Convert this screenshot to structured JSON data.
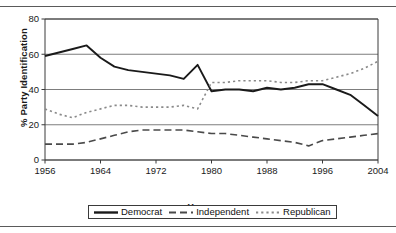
{
  "chart_data": {
    "type": "line",
    "title": "",
    "xlabel": "Year",
    "ylabel": "% Party Identification",
    "xlim": [
      1956,
      2004
    ],
    "ylim": [
      0,
      80
    ],
    "xticks": [
      1956,
      1964,
      1972,
      1980,
      1988,
      1996,
      2004
    ],
    "yticks": [
      0,
      20,
      40,
      60,
      80
    ],
    "grid": "horizontal",
    "legend_position": "bottom",
    "x": [
      1956,
      1958,
      1960,
      1962,
      1964,
      1966,
      1968,
      1970,
      1972,
      1974,
      1976,
      1978,
      1980,
      1982,
      1984,
      1986,
      1988,
      1990,
      1992,
      1994,
      1996,
      1998,
      2000,
      2002,
      2004
    ],
    "series": [
      {
        "name": "Democrat",
        "style": "solid",
        "color": "#1a1a1a",
        "values": [
          59,
          61,
          63,
          65,
          58,
          53,
          51,
          50,
          49,
          48,
          46,
          54,
          39,
          40,
          40,
          39,
          41,
          40,
          41,
          43,
          43,
          40,
          37,
          31,
          25
        ]
      },
      {
        "name": "Independent",
        "style": "dashed",
        "color": "#4a4a4a",
        "values": [
          9,
          9,
          9,
          10,
          12,
          14,
          16,
          17,
          17,
          17,
          17,
          16,
          15,
          15,
          14,
          13,
          12,
          11,
          10,
          8,
          11,
          12,
          13,
          14,
          15
        ]
      },
      {
        "name": "Republican",
        "style": "dotted",
        "color": "#8a8a8a",
        "values": [
          29,
          26,
          24,
          27,
          29,
          31,
          31,
          30,
          30,
          30,
          31,
          29,
          44,
          44,
          45,
          45,
          45,
          44,
          44,
          45,
          45,
          47,
          49,
          52,
          56
        ]
      }
    ]
  },
  "legend": {
    "items": [
      {
        "label": "Democrat",
        "style": "solid"
      },
      {
        "label": "Independent",
        "style": "dashed"
      },
      {
        "label": "Republican",
        "style": "dotted"
      }
    ]
  },
  "axes": {
    "y_label": "% Party Identification",
    "x_label": "Year",
    "y_ticks": [
      "80",
      "60",
      "40",
      "20",
      "0"
    ],
    "x_ticks": [
      "1956",
      "1964",
      "1972",
      "1980",
      "1988",
      "1996",
      "2004"
    ]
  },
  "colors": {
    "democrat": "#1a1a1a",
    "independent": "#4a4a4a",
    "republican": "#8a8a8a",
    "frame": "#3a3a3a",
    "grid": "#6e6e6e"
  }
}
